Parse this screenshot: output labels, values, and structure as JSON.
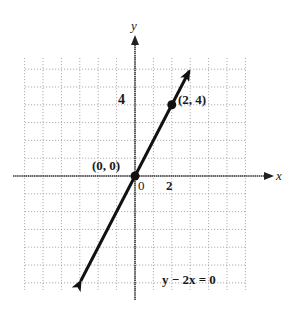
{
  "chart_data": {
    "type": "line",
    "title": "",
    "xlabel": "x",
    "ylabel": "y",
    "equation": "y − 2x = 0",
    "xlim": [
      -6,
      6
    ],
    "ylim": [
      -6,
      7
    ],
    "grid": true,
    "x_tick_labels": [
      {
        "value": 0,
        "label": "0"
      },
      {
        "value": 2,
        "label": "2"
      }
    ],
    "y_tick_labels": [
      {
        "value": 4,
        "label": "4"
      }
    ],
    "series": [
      {
        "name": "y − 2x = 0",
        "slope": 2,
        "intercept": 0,
        "x": [
          -3,
          3
        ],
        "y": [
          -6,
          6
        ]
      }
    ],
    "points": [
      {
        "x": 0,
        "y": 0,
        "label": "(0, 0)"
      },
      {
        "x": 2,
        "y": 4,
        "label": "(2, 4)"
      }
    ]
  },
  "labels": {
    "x_axis": "x",
    "y_axis": "y",
    "tick_0": "0",
    "tick_x2": "2",
    "tick_y4": "4",
    "point_origin": "(0, 0)",
    "point_24": "(2, 4)",
    "equation": "y − 2x = 0"
  }
}
